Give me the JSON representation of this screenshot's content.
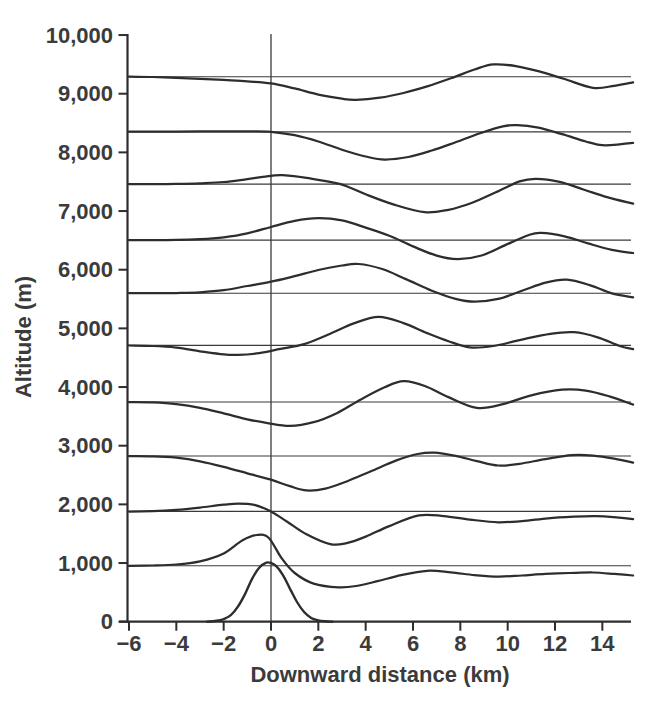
{
  "figure": {
    "y_axis": {
      "label": "Altitude (m)",
      "ticks": [
        {
          "value": 0,
          "label": "0"
        },
        {
          "value": 1000,
          "label": "1,000"
        },
        {
          "value": 2000,
          "label": "2,000"
        },
        {
          "value": 3000,
          "label": "3,000"
        },
        {
          "value": 4000,
          "label": "4,000"
        },
        {
          "value": 5000,
          "label": "5,000"
        },
        {
          "value": 6000,
          "label": "6,000"
        },
        {
          "value": 7000,
          "label": "7,000"
        },
        {
          "value": 8000,
          "label": "8,000"
        },
        {
          "value": 9000,
          "label": "9,000"
        },
        {
          "value": 10000,
          "label": "10,000"
        }
      ]
    },
    "x_axis": {
      "label": "Downward distance (km)",
      "ticks": [
        {
          "value": -6,
          "label": "−6"
        },
        {
          "value": -4,
          "label": "−4"
        },
        {
          "value": -2,
          "label": "−2"
        },
        {
          "value": 0,
          "label": "0"
        },
        {
          "value": 2,
          "label": "2"
        },
        {
          "value": 4,
          "label": "4"
        },
        {
          "value": 6,
          "label": "6"
        },
        {
          "value": 8,
          "label": "8"
        },
        {
          "value": 10,
          "label": "10"
        },
        {
          "value": 12,
          "label": "12"
        },
        {
          "value": 14,
          "label": "14"
        }
      ]
    }
  },
  "colors": {
    "curve": "#2d2d2d",
    "reference_line": "#3a3a3a",
    "axis": "#2d2d2d",
    "zero_line": "#3a3a3a",
    "text": "#3b3b3b",
    "background": "#ffffff"
  },
  "chart_data": {
    "type": "line",
    "title": "",
    "xlabel": "Downward distance (km)",
    "ylabel": "Altitude (m)",
    "xlim": [
      -6,
      15.3
    ],
    "ylim": [
      0,
      10000
    ],
    "x_ticks": [
      -6,
      -4,
      -2,
      0,
      2,
      4,
      6,
      8,
      10,
      12,
      14
    ],
    "y_ticks": [
      0,
      1000,
      2000,
      3000,
      4000,
      5000,
      6000,
      7000,
      8000,
      9000,
      10000
    ],
    "grid": "off",
    "legend": "none",
    "annotations": "thin horizontal reference line at each streamline rest altitude; thin vertical line at x = 0 spanning full height",
    "reference_altitudes_m": [
      955,
      1880,
      2825,
      3745,
      4710,
      5600,
      6505,
      7460,
      8350,
      9290
    ],
    "terrain": {
      "name": "mountain-profile",
      "peak_height_m": 1005,
      "points": [
        [
          -2.7,
          0
        ],
        [
          -2.3,
          15
        ],
        [
          -2.0,
          45
        ],
        [
          -1.7,
          110
        ],
        [
          -1.4,
          255
        ],
        [
          -1.1,
          470
        ],
        [
          -0.8,
          730
        ],
        [
          -0.5,
          920
        ],
        [
          -0.2,
          1005
        ],
        [
          0.0,
          1000
        ],
        [
          0.2,
          955
        ],
        [
          0.5,
          800
        ],
        [
          0.8,
          565
        ],
        [
          1.1,
          335
        ],
        [
          1.4,
          165
        ],
        [
          1.7,
          65
        ],
        [
          2.0,
          22
        ],
        [
          2.3,
          6
        ],
        [
          2.6,
          0
        ]
      ]
    },
    "series": [
      {
        "name": "streamline-955",
        "rest_altitude_m": 955,
        "points": [
          [
            -6,
            952
          ],
          [
            -5,
            958
          ],
          [
            -4,
            975
          ],
          [
            -3,
            1030
          ],
          [
            -2,
            1165
          ],
          [
            -1.2,
            1390
          ],
          [
            -0.6,
            1478
          ],
          [
            -0.1,
            1432
          ],
          [
            0.45,
            1080
          ],
          [
            1,
            830
          ],
          [
            1.8,
            650
          ],
          [
            2.85,
            585
          ],
          [
            3.6,
            608
          ],
          [
            4.5,
            690
          ],
          [
            5.5,
            795
          ],
          [
            6.6,
            868
          ],
          [
            7.6,
            840
          ],
          [
            8.6,
            795
          ],
          [
            9.6,
            768
          ],
          [
            10.6,
            788
          ],
          [
            11.6,
            815
          ],
          [
            12.6,
            830
          ],
          [
            13.6,
            838
          ],
          [
            14.5,
            815
          ],
          [
            15.3,
            788
          ]
        ]
      },
      {
        "name": "streamline-1880",
        "rest_altitude_m": 1880,
        "points": [
          [
            -6,
            1878
          ],
          [
            -5,
            1885
          ],
          [
            -4,
            1905
          ],
          [
            -3,
            1945
          ],
          [
            -2,
            1995
          ],
          [
            -1.4,
            2015
          ],
          [
            -0.7,
            1992
          ],
          [
            0,
            1880
          ],
          [
            0.7,
            1700
          ],
          [
            1.5,
            1490
          ],
          [
            2.5,
            1322
          ],
          [
            3.2,
            1340
          ],
          [
            4,
            1450
          ],
          [
            5,
            1630
          ],
          [
            6.25,
            1812
          ],
          [
            7.3,
            1800
          ],
          [
            8.4,
            1740
          ],
          [
            9.6,
            1695
          ],
          [
            10.6,
            1715
          ],
          [
            11.7,
            1762
          ],
          [
            12.8,
            1790
          ],
          [
            13.7,
            1800
          ],
          [
            14.6,
            1780
          ],
          [
            15.3,
            1748
          ]
        ]
      },
      {
        "name": "streamline-2825",
        "rest_altitude_m": 2825,
        "points": [
          [
            -6,
            2822
          ],
          [
            -5,
            2818
          ],
          [
            -4,
            2795
          ],
          [
            -3,
            2735
          ],
          [
            -2,
            2640
          ],
          [
            -1,
            2530
          ],
          [
            0,
            2420
          ],
          [
            0.8,
            2310
          ],
          [
            1.5,
            2238
          ],
          [
            2.3,
            2268
          ],
          [
            3.2,
            2390
          ],
          [
            4.2,
            2560
          ],
          [
            5.3,
            2750
          ],
          [
            6.2,
            2858
          ],
          [
            6.9,
            2882
          ],
          [
            7.8,
            2828
          ],
          [
            8.7,
            2738
          ],
          [
            9.6,
            2662
          ],
          [
            10.5,
            2692
          ],
          [
            11.6,
            2772
          ],
          [
            12.7,
            2838
          ],
          [
            13.6,
            2832
          ],
          [
            14.5,
            2780
          ],
          [
            15.3,
            2712
          ]
        ]
      },
      {
        "name": "streamline-3745",
        "rest_altitude_m": 3745,
        "points": [
          [
            -6,
            3743
          ],
          [
            -5,
            3738
          ],
          [
            -4,
            3710
          ],
          [
            -3,
            3645
          ],
          [
            -2,
            3550
          ],
          [
            -1,
            3450
          ],
          [
            -0.2,
            3390
          ],
          [
            0.8,
            3338
          ],
          [
            1.8,
            3400
          ],
          [
            2.8,
            3560
          ],
          [
            3.8,
            3790
          ],
          [
            4.8,
            3995
          ],
          [
            5.6,
            4100
          ],
          [
            6.5,
            4018
          ],
          [
            7.5,
            3828
          ],
          [
            8.7,
            3645
          ],
          [
            9.8,
            3710
          ],
          [
            11,
            3860
          ],
          [
            12.3,
            3955
          ],
          [
            13.3,
            3940
          ],
          [
            14.3,
            3840
          ],
          [
            15.3,
            3700
          ]
        ]
      },
      {
        "name": "streamline-4710",
        "rest_altitude_m": 4710,
        "points": [
          [
            -6,
            4708
          ],
          [
            -5,
            4700
          ],
          [
            -4,
            4672
          ],
          [
            -3,
            4610
          ],
          [
            -2,
            4556
          ],
          [
            -1.4,
            4548
          ],
          [
            -0.5,
            4578
          ],
          [
            0.4,
            4650
          ],
          [
            1.4,
            4732
          ],
          [
            2.4,
            4892
          ],
          [
            3.5,
            5085
          ],
          [
            4.55,
            5195
          ],
          [
            5.6,
            5090
          ],
          [
            6.6,
            4920
          ],
          [
            7.5,
            4782
          ],
          [
            8.4,
            4675
          ],
          [
            9.4,
            4700
          ],
          [
            10.5,
            4800
          ],
          [
            11.8,
            4908
          ],
          [
            12.8,
            4935
          ],
          [
            13.8,
            4848
          ],
          [
            14.7,
            4705
          ],
          [
            15.3,
            4645
          ]
        ]
      },
      {
        "name": "streamline-5600",
        "rest_altitude_m": 5600,
        "points": [
          [
            -6,
            5602
          ],
          [
            -5,
            5600
          ],
          [
            -4,
            5602
          ],
          [
            -3,
            5615
          ],
          [
            -2,
            5650
          ],
          [
            -1,
            5722
          ],
          [
            0,
            5795
          ],
          [
            1,
            5890
          ],
          [
            2,
            5995
          ],
          [
            3,
            6072
          ],
          [
            3.7,
            6098
          ],
          [
            4.7,
            6012
          ],
          [
            5.7,
            5840
          ],
          [
            6.8,
            5640
          ],
          [
            7.8,
            5502
          ],
          [
            8.6,
            5455
          ],
          [
            9.6,
            5502
          ],
          [
            10.6,
            5640
          ],
          [
            11.6,
            5780
          ],
          [
            12.5,
            5832
          ],
          [
            13.5,
            5732
          ],
          [
            14.4,
            5598
          ],
          [
            15.3,
            5530
          ]
        ]
      },
      {
        "name": "streamline-6505",
        "rest_altitude_m": 6505,
        "points": [
          [
            -6,
            6505
          ],
          [
            -5,
            6505
          ],
          [
            -4,
            6508
          ],
          [
            -3,
            6520
          ],
          [
            -2,
            6552
          ],
          [
            -1,
            6620
          ],
          [
            0,
            6728
          ],
          [
            1,
            6832
          ],
          [
            2,
            6878
          ],
          [
            3,
            6840
          ],
          [
            4,
            6718
          ],
          [
            5,
            6578
          ],
          [
            6,
            6398
          ],
          [
            7,
            6240
          ],
          [
            7.9,
            6180
          ],
          [
            8.9,
            6242
          ],
          [
            9.9,
            6420
          ],
          [
            10.9,
            6592
          ],
          [
            11.4,
            6628
          ],
          [
            12.4,
            6570
          ],
          [
            13.4,
            6448
          ],
          [
            14.4,
            6338
          ],
          [
            15.3,
            6285
          ]
        ]
      },
      {
        "name": "streamline-7460",
        "rest_altitude_m": 7460,
        "points": [
          [
            -6,
            7460
          ],
          [
            -5,
            7460
          ],
          [
            -4,
            7462
          ],
          [
            -3,
            7472
          ],
          [
            -2,
            7495
          ],
          [
            -1,
            7545
          ],
          [
            0,
            7600
          ],
          [
            0.5,
            7612
          ],
          [
            1.5,
            7565
          ],
          [
            2.9,
            7462
          ],
          [
            4,
            7285
          ],
          [
            5.2,
            7110
          ],
          [
            6.5,
            6980
          ],
          [
            7.5,
            7022
          ],
          [
            8.5,
            7142
          ],
          [
            9.5,
            7320
          ],
          [
            10.5,
            7505
          ],
          [
            11.2,
            7550
          ],
          [
            12.2,
            7498
          ],
          [
            13.2,
            7368
          ],
          [
            14.2,
            7238
          ],
          [
            15.3,
            7125
          ]
        ]
      },
      {
        "name": "streamline-8350",
        "rest_altitude_m": 8350,
        "points": [
          [
            -6,
            8352
          ],
          [
            -5,
            8352
          ],
          [
            -4,
            8355
          ],
          [
            -3,
            8358
          ],
          [
            -2,
            8360
          ],
          [
            -1,
            8358
          ],
          [
            0,
            8350
          ],
          [
            1,
            8292
          ],
          [
            2,
            8185
          ],
          [
            3,
            8045
          ],
          [
            4,
            7930
          ],
          [
            4.8,
            7878
          ],
          [
            5.8,
            7922
          ],
          [
            6.8,
            8032
          ],
          [
            7.8,
            8172
          ],
          [
            8.8,
            8322
          ],
          [
            9.8,
            8445
          ],
          [
            10.4,
            8465
          ],
          [
            11.3,
            8420
          ],
          [
            12.3,
            8310
          ],
          [
            13.3,
            8185
          ],
          [
            14,
            8122
          ],
          [
            14.8,
            8140
          ],
          [
            15.3,
            8162
          ]
        ]
      },
      {
        "name": "streamline-9290",
        "rest_altitude_m": 9290,
        "points": [
          [
            -6,
            9290
          ],
          [
            -5,
            9285
          ],
          [
            -4,
            9272
          ],
          [
            -3,
            9255
          ],
          [
            -2,
            9235
          ],
          [
            -1,
            9210
          ],
          [
            0,
            9176
          ],
          [
            1,
            9090
          ],
          [
            2,
            8985
          ],
          [
            3,
            8915
          ],
          [
            3.6,
            8896
          ],
          [
            4.6,
            8932
          ],
          [
            5.6,
            9012
          ],
          [
            6.6,
            9125
          ],
          [
            7.6,
            9262
          ],
          [
            8.6,
            9412
          ],
          [
            9.4,
            9500
          ],
          [
            10.4,
            9468
          ],
          [
            11.4,
            9372
          ],
          [
            12.4,
            9250
          ],
          [
            13.6,
            9100
          ],
          [
            14.5,
            9135
          ],
          [
            15.3,
            9195
          ]
        ]
      }
    ]
  }
}
